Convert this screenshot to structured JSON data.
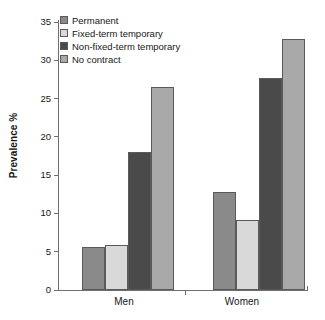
{
  "chart_data": {
    "type": "bar",
    "title": "",
    "subtitle": "",
    "xlabel": "",
    "ylabel": "Prevalence %",
    "categories": [
      "Men",
      "Women"
    ],
    "series": [
      {
        "name": "Permanent",
        "values": [
          5.6,
          12.8
        ],
        "color": "#8a8a8a"
      },
      {
        "name": "Fixed-term temporary",
        "values": [
          5.9,
          9.1
        ],
        "color": "#d9d9d9"
      },
      {
        "name": "Non-fixed-term temporary",
        "values": [
          18.0,
          27.7
        ],
        "color": "#4a4a4a"
      },
      {
        "name": "No contract",
        "values": [
          26.5,
          32.8
        ],
        "color": "#a9a9a9"
      }
    ],
    "ylim": [
      0,
      35
    ],
    "yticks": [
      0,
      5,
      10,
      15,
      20,
      25,
      30,
      35
    ],
    "ytick_labels": [
      "0",
      "5",
      "10",
      "15",
      "20",
      "25",
      "30",
      "35"
    ],
    "grid": false,
    "legend_position": "upper-left-inside",
    "bar_edge_color": "#5a5a5a",
    "axis_color": "#6e6e6e",
    "background": "#ffffff"
  },
  "legend": {
    "items": [
      {
        "label": "Permanent"
      },
      {
        "label": "Fixed-term temporary"
      },
      {
        "label": "Non-fixed-term temporary"
      },
      {
        "label": "No contract"
      }
    ]
  },
  "axes": {
    "y_title": "Prevalence %",
    "y_tick_labels": [
      "35",
      "30",
      "25",
      "20",
      "15",
      "10",
      "5",
      "0"
    ],
    "x_labels": [
      "Men",
      "Women"
    ]
  }
}
